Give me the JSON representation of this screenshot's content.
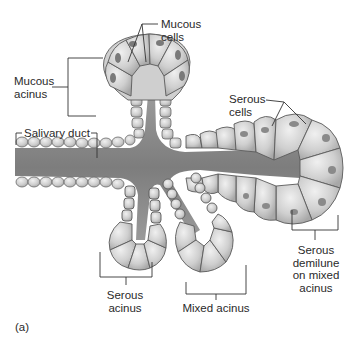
{
  "figure": {
    "panel_label": "(a)",
    "labels": {
      "mucous_cells": [
        "Mucous",
        "cells"
      ],
      "mucous_acinus": [
        "Mucous",
        "acinus"
      ],
      "salivary_duct": "Salivary duct",
      "serous_cells": [
        "Serous",
        "cells"
      ],
      "serous_acinus": [
        "Serous",
        "acinus"
      ],
      "mixed_acinus": "Mixed acinus",
      "serous_demilune": [
        "Serous",
        "demilune",
        "on mixed",
        "acinus"
      ]
    }
  },
  "colors": {
    "background": "#ffffff",
    "lumen": "#8a8a8a",
    "cell_fill": "#d4d4d4",
    "cell_stroke": "#6a6a6a",
    "nucleus": "#8c8c8c",
    "leader_line": "#333333"
  }
}
